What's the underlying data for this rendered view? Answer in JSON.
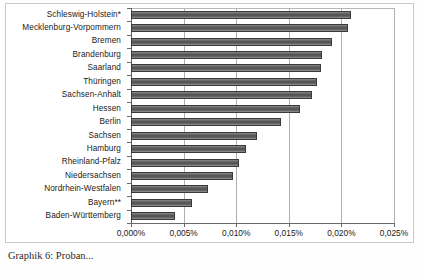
{
  "chart_data": {
    "type": "bar",
    "orientation": "horizontal",
    "title": "",
    "subtitle": "",
    "xlabel": "",
    "ylabel": "",
    "xlim": [
      0,
      0.025
    ],
    "grid": true,
    "legend": false,
    "legend_position": "none",
    "bar_color": "#5a5a5a",
    "categories": [
      "Schleswig-Holstein*",
      "Mecklenburg-Vorpommern",
      "Bremen",
      "Brandenburg",
      "Saarland",
      "Thüringen",
      "Sachsen-Anhalt",
      "Hessen",
      "Berlin",
      "Sachsen",
      "Hamburg",
      "Rheinland-Pfalz",
      "Niedersachsen",
      "Nordrhein-Westfalen",
      "Bayern**",
      "Baden-Württemberg"
    ],
    "values": [
      0.0209,
      0.0206,
      0.0191,
      0.0182,
      0.0181,
      0.0177,
      0.0172,
      0.0161,
      0.0143,
      0.012,
      0.0109,
      0.0103,
      0.0097,
      0.0073,
      0.0058,
      0.0042
    ],
    "value_display": [
      "0,0209%",
      "0,0206%",
      "0,0191%",
      "0,0182%",
      "0,0181%",
      "0,0177%",
      "0,0172%",
      "0,0161%",
      "0,0143%",
      "0,0120%",
      "0,0109%",
      "0,0103%",
      "0,0097%",
      "0,0073%",
      "0,0058%",
      "0,0042%"
    ],
    "xticks": [
      0,
      0.005,
      0.01,
      0.015,
      0.02,
      0.025
    ],
    "xtick_labels": [
      "0,000%",
      "0,005%",
      "0,010%",
      "0,015%",
      "0,020%",
      "0,025%"
    ]
  },
  "caption": {
    "text": "Graphik 6: Proban..."
  }
}
